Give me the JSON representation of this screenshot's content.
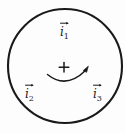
{
  "figure": {
    "type": "physics-vector-diagram",
    "background_color": "#fdfdfd",
    "stroke_color": "#1a1a1a",
    "canvas": {
      "width": 125,
      "height": 133
    }
  },
  "circle": {
    "name": "amperian-loop",
    "center_x": 65,
    "center_y": 66,
    "radius": 57,
    "stroke_width": 2.0,
    "fill": "none"
  },
  "center_marker": {
    "symbol": "+",
    "x": 64,
    "y": 67,
    "font_size": 13
  },
  "circulation_arrow": {
    "name": "circulation-direction-arrow",
    "direction": "counterclockwise",
    "start_x": 47,
    "start_y": 74,
    "end_x": 87,
    "end_y": 68,
    "sag_y": 85,
    "arrowhead": "up-right"
  },
  "labels": [
    {
      "id": "i1",
      "base": "i",
      "subscript": "1",
      "accent": "vector-arrow",
      "text": "i₁",
      "x": 60,
      "y": 26
    },
    {
      "id": "i2",
      "base": "i",
      "subscript": "2",
      "accent": "vector-arrow",
      "text": "i₂",
      "x": 25,
      "y": 88
    },
    {
      "id": "i3",
      "base": "i",
      "subscript": "3",
      "accent": "vector-arrow",
      "text": "i₃",
      "x": 93,
      "y": 88
    }
  ]
}
